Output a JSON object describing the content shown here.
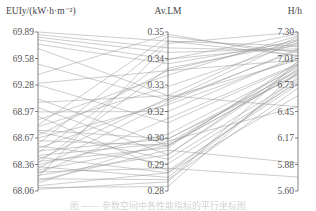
{
  "chart_data": {
    "type": "parallel-coordinates",
    "title": "",
    "axes": [
      {
        "name": "EUIy/(kW·h·m⁻²)",
        "ticks": [
          "69.89",
          "69.58",
          "69.28",
          "68.97",
          "68.67",
          "68.36",
          "68.06"
        ],
        "range": [
          68.06,
          69.89
        ]
      },
      {
        "name": "Av.LM",
        "ticks": [
          "0.35",
          "0.34",
          "0.33",
          "0.32",
          "0.30",
          "0.29",
          "0.28"
        ],
        "range": [
          0.28,
          0.35
        ]
      },
      {
        "name": "H/h",
        "ticks": [
          "7.30",
          "7.01",
          "6.73",
          "6.45",
          "6.17",
          "5.88",
          "5.60"
        ],
        "range": [
          5.6,
          7.3
        ]
      }
    ],
    "series": [
      [
        69.89,
        0.346,
        7.05
      ],
      [
        69.86,
        0.343,
        7.1
      ],
      [
        69.83,
        0.341,
        7.12
      ],
      [
        69.8,
        0.338,
        7.15
      ],
      [
        69.75,
        0.336,
        7.2
      ],
      [
        69.52,
        0.32,
        7.22
      ],
      [
        69.3,
        0.333,
        7.0
      ],
      [
        69.28,
        0.31,
        6.95
      ],
      [
        69.12,
        0.3,
        6.85
      ],
      [
        69.08,
        0.322,
        7.25
      ],
      [
        69.02,
        0.296,
        6.9
      ],
      [
        68.97,
        0.315,
        7.05
      ],
      [
        68.82,
        0.348,
        7.08
      ],
      [
        68.8,
        0.326,
        7.18
      ],
      [
        68.76,
        0.303,
        6.88
      ],
      [
        68.74,
        0.294,
        6.8
      ],
      [
        68.7,
        0.333,
        7.22
      ],
      [
        68.67,
        0.318,
        7.02
      ],
      [
        68.64,
        0.3,
        6.95
      ],
      [
        68.6,
        0.346,
        7.15
      ],
      [
        68.58,
        0.292,
        6.76
      ],
      [
        68.55,
        0.32,
        7.1
      ],
      [
        68.52,
        0.303,
        6.84
      ],
      [
        68.5,
        0.338,
        7.28
      ],
      [
        68.47,
        0.301,
        6.9
      ],
      [
        68.45,
        0.288,
        6.78
      ],
      [
        68.42,
        0.321,
        7.0
      ],
      [
        68.4,
        0.299,
        6.98
      ],
      [
        68.38,
        0.334,
        7.18
      ],
      [
        68.36,
        0.305,
        6.92
      ],
      [
        68.34,
        0.286,
        6.82
      ],
      [
        68.32,
        0.319,
        7.12
      ],
      [
        68.3,
        0.3,
        6.86
      ],
      [
        68.28,
        0.29,
        5.75
      ],
      [
        68.26,
        0.312,
        6.96
      ],
      [
        68.24,
        0.296,
        6.94
      ],
      [
        68.22,
        0.345,
        7.3
      ],
      [
        68.2,
        0.285,
        6.7
      ],
      [
        68.18,
        0.298,
        5.9
      ],
      [
        68.15,
        0.302,
        6.5
      ],
      [
        68.12,
        0.288,
        6.62
      ],
      [
        68.1,
        0.282,
        6.88
      ],
      [
        68.08,
        0.284,
        6.99
      ],
      [
        69.7,
        0.322,
        6.5
      ],
      [
        69.4,
        0.349,
        7.04
      ],
      [
        68.88,
        0.331,
        7.26
      ],
      [
        68.92,
        0.289,
        6.74
      ]
    ]
  },
  "caption": "图 —— 参数空间中各性能指标的平行坐标图"
}
